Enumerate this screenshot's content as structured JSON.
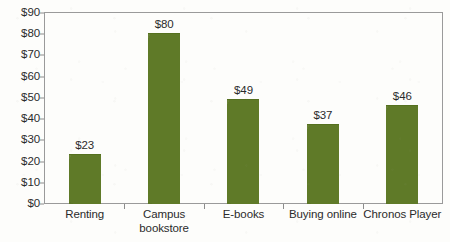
{
  "chart_data": {
    "type": "bar",
    "title": "",
    "subtitle": "",
    "xlabel": "",
    "ylabel": "",
    "categories": [
      "Renting",
      "Campus bookstore",
      "E-books",
      "Buying online",
      "Chronos Player"
    ],
    "category_lines": [
      [
        "Renting"
      ],
      [
        "Campus",
        "bookstore"
      ],
      [
        "E-books"
      ],
      [
        "Buying online"
      ],
      [
        "Chronos Player"
      ]
    ],
    "values": [
      23,
      80,
      49,
      37,
      46
    ],
    "data_labels": [
      "$23",
      "$80",
      "$49",
      "$37",
      "$46"
    ],
    "ylim": [
      0,
      90
    ],
    "ytick_values": [
      0,
      10,
      20,
      30,
      40,
      50,
      60,
      70,
      80,
      90
    ],
    "ytick_labels": [
      "$0",
      "$10",
      "$20",
      "$30",
      "$40",
      "$50",
      "$60",
      "$70",
      "$80",
      "$90"
    ],
    "grid": false,
    "legend": false,
    "legend_position": "none",
    "value_prefix": "$",
    "orientation": "vertical",
    "bar_color": "#5F7A28",
    "frame_color": "#9A9A9A",
    "text_color": "#2B2B2B",
    "background_color": "#FDFDFB"
  }
}
